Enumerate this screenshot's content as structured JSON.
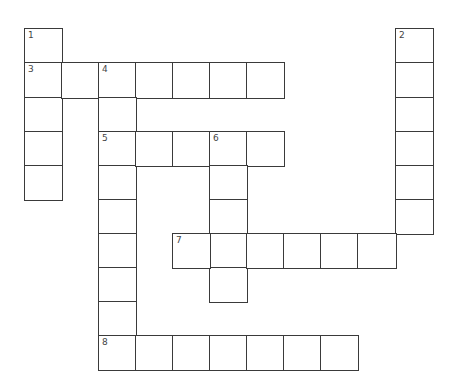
{
  "puzzle": {
    "type": "crossword",
    "grid": {
      "origin_x": 24,
      "origin_y": 28,
      "col_starts": [
        24,
        61,
        98,
        135,
        172,
        209,
        246,
        283,
        320,
        357,
        395
      ],
      "col_end": 432,
      "row_starts": [
        28,
        62,
        97,
        131,
        165,
        199,
        233,
        267,
        301,
        335
      ],
      "row_end": 369
    },
    "colors": {
      "line": "#3a3a3a",
      "cell_background": "#ffffff",
      "number": "#444444"
    },
    "entries": [
      {
        "number": "1",
        "direction": "down",
        "row": 0,
        "col": 0,
        "length": 5
      },
      {
        "number": "2",
        "direction": "down",
        "row": 0,
        "col": 10,
        "length": 6
      },
      {
        "number": "3",
        "direction": "across",
        "row": 1,
        "col": 0,
        "length": 7
      },
      {
        "number": "4",
        "direction": "down",
        "row": 1,
        "col": 2,
        "length": 9
      },
      {
        "number": "5",
        "direction": "across",
        "row": 3,
        "col": 2,
        "length": 5
      },
      {
        "number": "6",
        "direction": "down",
        "row": 3,
        "col": 5,
        "length": 5
      },
      {
        "number": "7",
        "direction": "across",
        "row": 6,
        "col": 4,
        "length": 6
      },
      {
        "number": "8",
        "direction": "across",
        "row": 9,
        "col": 2,
        "length": 7
      }
    ]
  }
}
